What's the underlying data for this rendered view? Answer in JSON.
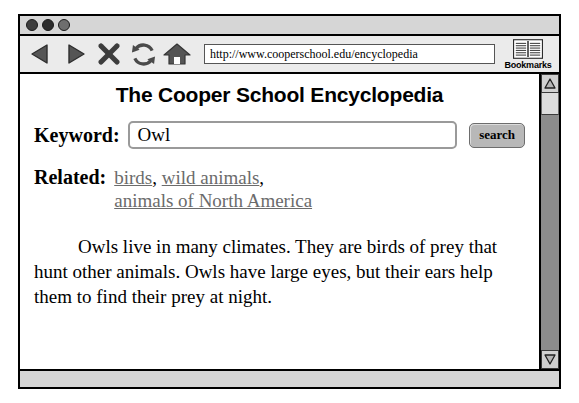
{
  "window": {
    "dots": [
      {
        "name": "close",
        "color": "#3d3d3d"
      },
      {
        "name": "minimize",
        "color": "#2b2b2b"
      },
      {
        "name": "maximize",
        "color": "#6e6e6e"
      }
    ]
  },
  "toolbar": {
    "icons": [
      {
        "name": "back-icon",
        "label": "Back"
      },
      {
        "name": "forward-icon",
        "label": "Forward"
      },
      {
        "name": "stop-icon",
        "label": "Stop"
      },
      {
        "name": "reload-icon",
        "label": "Reload"
      },
      {
        "name": "home-icon",
        "label": "Home"
      }
    ],
    "url": "http://www.cooperschool.edu/encyclopedia",
    "url_placeholder": "Enter web address",
    "bookmarks_label": "Bookmarks"
  },
  "page": {
    "title": "The Cooper School Encyclopedia",
    "keyword_label": "Keyword:",
    "keyword_value": "Owl",
    "keyword_placeholder": "Enter a keyword",
    "search_button_label": "search",
    "related_label": "Related:",
    "related_links": [
      "birds",
      "wild animals",
      "animals of North America"
    ],
    "article_text": "Owls live in many climates. They are birds of prey that hunt other animals. Owls have large eyes, but their ears help them to find their prey at night."
  },
  "scrollbar": {
    "up_arrow": "△",
    "down_arrow": "▽"
  },
  "colors": {
    "window_border": "#000000",
    "chrome_gray": "#d6d6d6",
    "toolbar_gray": "#ebebeb",
    "icon_gray": "#555555",
    "link_gray": "#6b6b6b",
    "button_gray": "#b8b8b8",
    "scroll_track": "#8c8c8c",
    "page_white": "#ffffff"
  }
}
